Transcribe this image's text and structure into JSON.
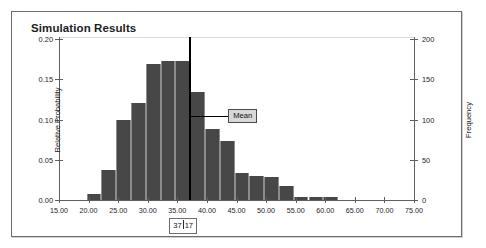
{
  "panel": {
    "title": "Simulation Results"
  },
  "chart_data": {
    "type": "bar",
    "title": "Simulation Results",
    "xlabel": "",
    "ylabel": "Relative Probability",
    "ylabel_secondary": "Frequency",
    "grid": false,
    "legend": null,
    "xlim": [
      15.0,
      75.0
    ],
    "ylim": [
      0.0,
      0.2
    ],
    "ylim_secondary": [
      0,
      200
    ],
    "xticks": [
      "15.00",
      "20.00",
      "25.00",
      "30.00",
      "35.00",
      "40.00",
      "45.00",
      "50.00",
      "55.00",
      "60.00",
      "65.00",
      "70.00",
      "75.00"
    ],
    "xtick_values": [
      15,
      20,
      25,
      30,
      35,
      40,
      45,
      50,
      55,
      60,
      65,
      70,
      75
    ],
    "yticks_left": [
      "0.00",
      "0.05",
      "0.10",
      "0.15",
      "0.20"
    ],
    "ytick_values_left": [
      0.0,
      0.05,
      0.1,
      0.15,
      0.2
    ],
    "yticks_right": [
      "0",
      "50",
      "100",
      "150",
      "200"
    ],
    "ytick_values_right": [
      0,
      50,
      100,
      150,
      200
    ],
    "bin_width": 2.5,
    "bin_starts": [
      19.5,
      22.0,
      24.5,
      27.0,
      29.5,
      32.0,
      34.5,
      37.0,
      39.5,
      42.0,
      44.5,
      47.0,
      49.5,
      52.0,
      54.5,
      57.0,
      59.5
    ],
    "categories": [
      "19.5-22.0",
      "22.0-24.5",
      "24.5-27.0",
      "27.0-29.5",
      "29.5-32.0",
      "32.0-34.5",
      "34.5-37.0",
      "37.0-39.5",
      "39.5-42.0",
      "42.0-44.5",
      "44.5-47.0",
      "47.0-49.5",
      "49.5-52.0",
      "52.0-54.5",
      "54.5-57.0",
      "57.0-59.5",
      "59.5-62.0"
    ],
    "values": [
      0.008,
      0.037,
      0.1,
      0.121,
      0.169,
      0.173,
      0.173,
      0.134,
      0.088,
      0.073,
      0.033,
      0.03,
      0.029,
      0.017,
      0.004,
      0.004,
      0.004
    ],
    "values_frequency": [
      8,
      37,
      100,
      121,
      169,
      173,
      173,
      134,
      88,
      73,
      33,
      30,
      29,
      17,
      4,
      4,
      4
    ],
    "bar_color": "#474747",
    "annotations": [
      {
        "name": "mean",
        "label": "Mean",
        "x": 37.17,
        "value_label_left": "37",
        "value_label_right": "17",
        "line_color": "#000000"
      }
    ]
  }
}
